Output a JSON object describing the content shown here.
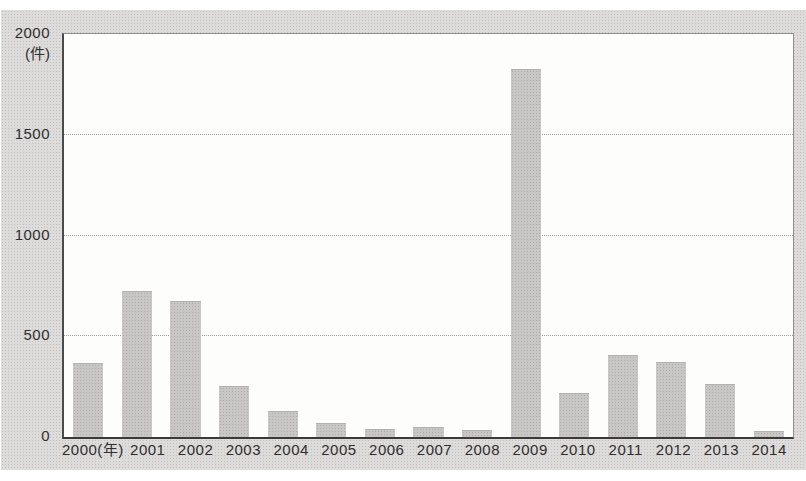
{
  "figure": {
    "panel_background": "#dedcda",
    "plot_background": "#fdfdfc",
    "bar_color": "#c9c7c5",
    "grid_color": "#9e9e9e",
    "axis_color": "#3a3a3a",
    "text_color": "#2e2e2e"
  },
  "chart_data": {
    "type": "bar",
    "title": "",
    "xlabel": "",
    "ylabel": "(件)",
    "categories": [
      "2000(年)",
      "2001",
      "2002",
      "2003",
      "2004",
      "2005",
      "2006",
      "2007",
      "2008",
      "2009",
      "2010",
      "2011",
      "2012",
      "2013",
      "2014"
    ],
    "values": [
      360,
      720,
      670,
      250,
      125,
      65,
      35,
      45,
      30,
      1820,
      215,
      400,
      365,
      260,
      25
    ],
    "ylim": [
      0,
      2000
    ],
    "yticks": [
      0,
      500,
      1000,
      1500,
      2000
    ],
    "grid": "horizontal-dotted",
    "legend": "none"
  }
}
